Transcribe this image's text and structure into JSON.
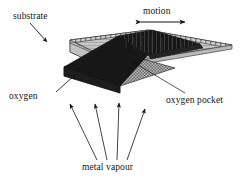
{
  "figure": {
    "background_color": "#ffffff",
    "ink_color": "#141414",
    "labels": {
      "substrate": "substrate",
      "motion": "motion",
      "oxygen": "oxygen",
      "oxygen_pocket": "oxygen pocket",
      "metal_vapour": "metal vapour"
    },
    "parts": [
      {
        "name": "substrate-slab",
        "description": "flat rectangular plate drawn in oblique 3D perspective",
        "fill": "#cfcfcf",
        "edge": "#1a1a1a"
      },
      {
        "name": "deposition-band",
        "description": "dark band running diagonally across the slab",
        "fill": "#1a1a1a"
      },
      {
        "name": "oxygen-pocket-region",
        "description": "cross-hatched wedge beneath the dark band",
        "fill": "#9a9a9a"
      }
    ],
    "arrows": {
      "motion": {
        "type": "double-headed-horizontal",
        "heads": 2,
        "direction": "left-right"
      },
      "substrate_pointer": {
        "type": "leader",
        "heads": 1
      },
      "oxygen_pointer": {
        "type": "leader",
        "heads": 1
      },
      "oxygen_pocket_pointer": {
        "type": "leader",
        "heads": 1
      },
      "metal_vapour": {
        "type": "vapour-flux",
        "count": 4,
        "direction": "upward-fanning"
      }
    }
  }
}
